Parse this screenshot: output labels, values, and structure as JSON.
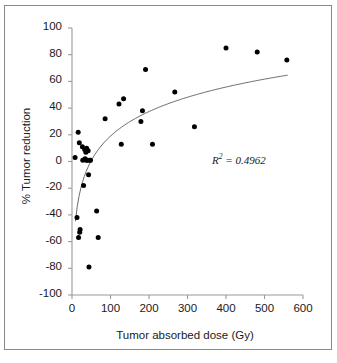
{
  "chart_data": {
    "type": "scatter",
    "title": "",
    "xlabel": "Tumor absorbed dose (Gy)",
    "ylabel": "% Tumor reduction",
    "xlim": [
      0,
      600
    ],
    "ylim": [
      -100,
      100
    ],
    "xticks": [
      0,
      100,
      200,
      300,
      400,
      500,
      600
    ],
    "yticks": [
      -100,
      -80,
      -60,
      -40,
      -20,
      0,
      20,
      40,
      60,
      80,
      100
    ],
    "xtick_labels": [
      "0",
      "100",
      "200",
      "300",
      "400",
      "500",
      "600"
    ],
    "ytick_labels": [
      "-100",
      "-80",
      "-60",
      "-40",
      "-20",
      "0",
      "20",
      "40",
      "60",
      "80",
      "100"
    ],
    "grid": false,
    "legend": false,
    "marker": "filled-circle",
    "marker_color": "#000000",
    "marker_size": 5,
    "points": [
      {
        "x": 8,
        "y": 3
      },
      {
        "x": 13,
        "y": -42
      },
      {
        "x": 16,
        "y": 22
      },
      {
        "x": 17,
        "y": -57
      },
      {
        "x": 19,
        "y": 14
      },
      {
        "x": 20,
        "y": -53
      },
      {
        "x": 21,
        "y": -51
      },
      {
        "x": 27,
        "y": 11
      },
      {
        "x": 28,
        "y": 1
      },
      {
        "x": 30,
        "y": -18
      },
      {
        "x": 33,
        "y": 9
      },
      {
        "x": 34,
        "y": 2
      },
      {
        "x": 36,
        "y": 7
      },
      {
        "x": 37,
        "y": 1
      },
      {
        "x": 38,
        "y": 10
      },
      {
        "x": 40,
        "y": 1
      },
      {
        "x": 42,
        "y": 8
      },
      {
        "x": 43,
        "y": -10
      },
      {
        "x": 44,
        "y": -79
      },
      {
        "x": 46,
        "y": 1
      },
      {
        "x": 48,
        "y": 1
      },
      {
        "x": 64,
        "y": -37
      },
      {
        "x": 68,
        "y": -57
      },
      {
        "x": 86,
        "y": 32
      },
      {
        "x": 122,
        "y": 43
      },
      {
        "x": 128,
        "y": 13
      },
      {
        "x": 134,
        "y": 47
      },
      {
        "x": 179,
        "y": 30
      },
      {
        "x": 183,
        "y": 38
      },
      {
        "x": 191,
        "y": 69
      },
      {
        "x": 209,
        "y": 13
      },
      {
        "x": 267,
        "y": 52
      },
      {
        "x": 318,
        "y": 26
      },
      {
        "x": 400,
        "y": 85
      },
      {
        "x": 481,
        "y": 82
      },
      {
        "x": 558,
        "y": 76
      }
    ],
    "trendline": {
      "type": "logarithmic",
      "equation_form": "y = a*ln(x) + b",
      "a": 26.5,
      "b": -103.0,
      "color": "#6b6b6b",
      "x_start": 9,
      "x_end": 560,
      "y_start": -45,
      "y_end": 64
    },
    "annotations": [
      {
        "name": "r-squared",
        "text_prefix": "R",
        "text_superscript": "2",
        "text_suffix": " = 0.4962",
        "full_text": "R2 = 0.4962",
        "value": 0.4962,
        "x": 430,
        "y": 18
      }
    ]
  },
  "figure": {
    "background_color": "#ffffff",
    "border_color": "#8a8a8a",
    "axis_color": "#9a9a9a",
    "text_color": "#1a1a1a"
  }
}
